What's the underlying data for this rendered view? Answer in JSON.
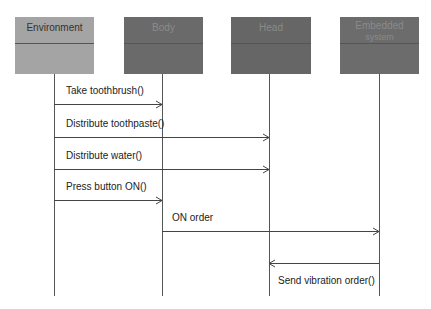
{
  "diagram": {
    "type": "sequence",
    "actors": [
      {
        "id": "environment",
        "label": "Environment",
        "label2": "",
        "x": 15,
        "lifeline_x": 54,
        "fill": "#a4a4a4",
        "text_color": "#333333"
      },
      {
        "id": "body",
        "label": "Body",
        "label2": "",
        "x": 124,
        "lifeline_x": 162,
        "fill": "#6a6a6a",
        "text_color": "#8a8a8a"
      },
      {
        "id": "head",
        "label": "Head",
        "label2": "",
        "x": 231,
        "lifeline_x": 269,
        "fill": "#666666",
        "text_color": "#8a8a8a"
      },
      {
        "id": "embedded",
        "label": "Embedded",
        "label2": "system",
        "x": 340,
        "lifeline_x": 379,
        "fill": "#6c6c6c",
        "text_color": "#8a8a8a"
      }
    ],
    "messages": [
      {
        "label": "Take toothbrush()",
        "from": "environment",
        "to": "body",
        "y": 104,
        "label_x": 66,
        "label_y": 83
      },
      {
        "label": "Distribute toothpaste()",
        "from": "environment",
        "to": "head",
        "y": 137,
        "label_x": 66,
        "label_y": 116
      },
      {
        "label": "Distribute water()",
        "from": "environment",
        "to": "head",
        "y": 169,
        "label_x": 66,
        "label_y": 148
      },
      {
        "label": "Press button ON()",
        "from": "environment",
        "to": "body",
        "y": 200,
        "label_x": 66,
        "label_y": 180
      },
      {
        "label": "ON order",
        "from": "body",
        "to": "embedded",
        "y": 231,
        "label_x": 172,
        "label_y": 211
      },
      {
        "label": "Send vibration order()",
        "from": "embedded",
        "to": "head",
        "y": 263,
        "label_x": 278,
        "label_y": 273
      }
    ]
  }
}
